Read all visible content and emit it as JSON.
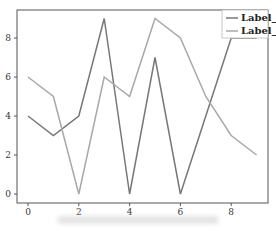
{
  "chart_data": {
    "type": "line",
    "title": "",
    "xlabel": "",
    "ylabel": "",
    "x": [
      0,
      1,
      2,
      3,
      4,
      5,
      6,
      7,
      8,
      9
    ],
    "series": [
      {
        "name": "Label_1",
        "values": [
          4,
          3,
          4,
          9,
          0,
          7,
          0,
          4,
          8,
          8
        ],
        "color": "#777777"
      },
      {
        "name": "Label_2",
        "values": [
          6,
          5,
          0,
          6,
          5,
          9,
          8,
          5,
          3,
          2
        ],
        "color": "#a8a8a8"
      }
    ],
    "xticks": [
      "0",
      "2",
      "4",
      "6",
      "8"
    ],
    "yticks": [
      "0",
      "2",
      "4",
      "6",
      "8"
    ],
    "xlim": [
      -0.45,
      9.45
    ],
    "ylim": [
      -0.45,
      9.45
    ],
    "grid": false,
    "legend_position": "upper right"
  },
  "legend": {
    "items": [
      "Label_1",
      "Label_2"
    ]
  }
}
